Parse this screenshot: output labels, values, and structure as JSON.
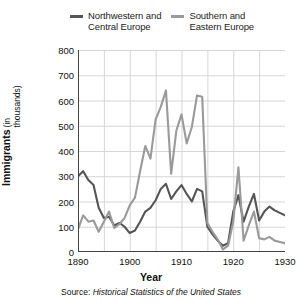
{
  "legend": {
    "entries": [
      {
        "label": "Northwestern and\nCentral Europe",
        "color": "#555555",
        "icon": "line-swatch-icon"
      },
      {
        "label": "Southern and\nEastern Europe",
        "color": "#9a9a9a",
        "icon": "line-swatch-icon"
      }
    ]
  },
  "axes": {
    "ylabel_main": "Immigrants",
    "ylabel_sub": "(in thousands)",
    "xlabel": "Year"
  },
  "source": {
    "prefix": "Source: ",
    "title": "Historical Statistics of the United States"
  },
  "chart_data": {
    "type": "line",
    "title": "",
    "subtitle": "",
    "xlabel": "Year",
    "ylabel": "Immigrants (in thousands)",
    "xlim": [
      1890,
      1930
    ],
    "ylim": [
      0,
      800
    ],
    "xticks": [
      1890,
      1900,
      1910,
      1920,
      1930
    ],
    "yticks": [
      0,
      100,
      200,
      300,
      400,
      500,
      600,
      700,
      800
    ],
    "grid": true,
    "legend_position": "top",
    "x": [
      1890,
      1891,
      1892,
      1893,
      1894,
      1895,
      1896,
      1897,
      1898,
      1899,
      1900,
      1901,
      1902,
      1903,
      1904,
      1905,
      1906,
      1907,
      1908,
      1909,
      1910,
      1911,
      1912,
      1913,
      1914,
      1915,
      1916,
      1917,
      1918,
      1919,
      1920,
      1921,
      1922,
      1923,
      1924,
      1925,
      1926,
      1927,
      1928,
      1929,
      1930
    ],
    "series": [
      {
        "name": "Northwestern and Central Europe",
        "color": "#555555",
        "values": [
          300,
          320,
          285,
          265,
          175,
          135,
          140,
          105,
          115,
          100,
          75,
          85,
          120,
          160,
          175,
          205,
          250,
          270,
          210,
          240,
          265,
          230,
          200,
          250,
          240,
          100,
          70,
          45,
          25,
          35,
          160,
          225,
          120,
          180,
          230,
          125,
          160,
          180,
          165,
          155,
          145
        ]
      },
      {
        "name": "Southern and Eastern Europe",
        "color": "#9a9a9a",
        "values": [
          90,
          145,
          120,
          125,
          80,
          120,
          160,
          95,
          110,
          135,
          185,
          215,
          320,
          420,
          370,
          525,
          575,
          640,
          310,
          480,
          545,
          430,
          495,
          620,
          615,
          115,
          80,
          50,
          10,
          25,
          120,
          335,
          45,
          105,
          160,
          55,
          50,
          60,
          45,
          40,
          35
        ]
      }
    ]
  }
}
